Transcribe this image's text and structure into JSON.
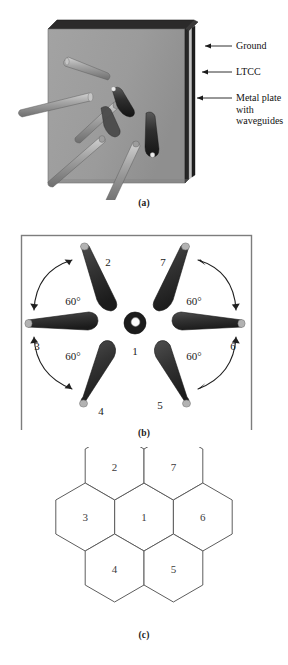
{
  "figure": {
    "panels": [
      {
        "id": "a",
        "label": "(a)",
        "callouts": [
          {
            "name": "ground",
            "text": "Ground"
          },
          {
            "name": "ltcc",
            "text": "LTCC"
          },
          {
            "name": "metal-plate",
            "text": "Metal plate\nwith\nwaveguides"
          }
        ]
      },
      {
        "id": "b",
        "label": "(b)",
        "element_numbers": [
          "1",
          "2",
          "3",
          "4",
          "5",
          "6",
          "7"
        ],
        "angle_labels": [
          "60°",
          "60°",
          "60°",
          "60°"
        ]
      },
      {
        "id": "c",
        "label": "(c)",
        "cell_numbers": [
          "1",
          "2",
          "3",
          "4",
          "5",
          "6",
          "7"
        ]
      }
    ],
    "caption_fragment": ""
  },
  "colors": {
    "slab_face": "#9a9a9a",
    "slab_top_dark": "#2a2a2a",
    "slab_edge_dark": "#302f2f",
    "ltcc_light": "#c9c9c9",
    "horn_light": "#a9a9a9",
    "horn_dark": "#3a3a3a",
    "horn_tip": "#b9b9b9",
    "frame_line": "#7a7a7a",
    "hex_line": "#5d5d5d",
    "text": "#1a1a1a",
    "arrow": "#2b2b2b"
  }
}
